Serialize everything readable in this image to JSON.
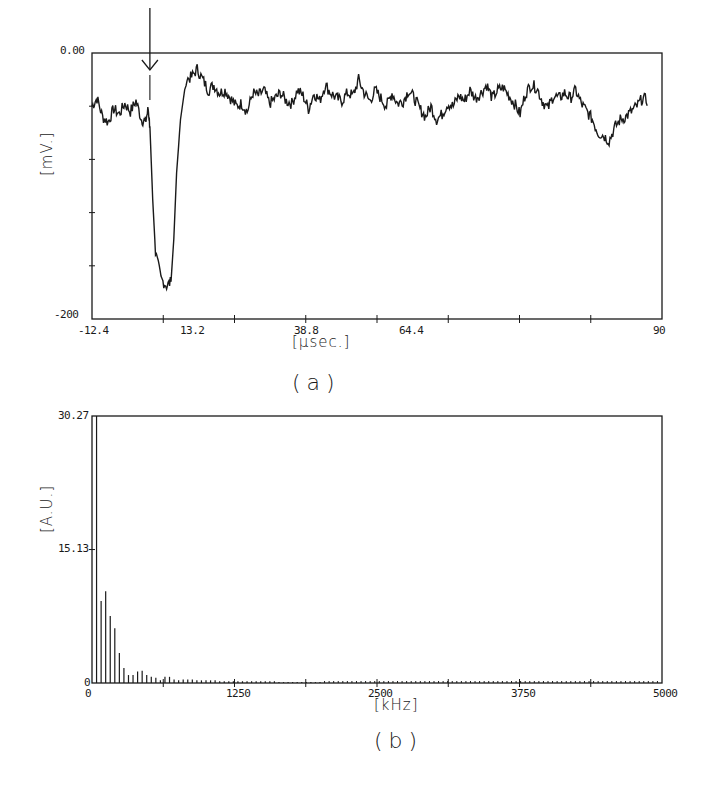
{
  "chart_data": [
    {
      "id": "a",
      "type": "line",
      "caption": "(a)",
      "title": "",
      "xlabel": "[µsec.]",
      "ylabel": "[mV.]",
      "xlim": [
        -12.4,
        90
      ],
      "ylim": [
        -200,
        0
      ],
      "x_ticks": [
        "-12.4",
        "13.2",
        "38.8",
        "64.4",
        "90"
      ],
      "y_ticks": [
        "0.00",
        "-200"
      ],
      "y_minor_ticks": 5,
      "x_minor_ticks": 8,
      "grid": false,
      "annotation": {
        "type": "arrow-down",
        "x": -2.0,
        "label": ""
      },
      "series": [
        {
          "name": "signal",
          "x": [
            -12.4,
            -11.5,
            -10.5,
            -9.5,
            -8.5,
            -7.5,
            -6.5,
            -5.5,
            -4.5,
            -3.5,
            -2.8,
            -2.3,
            -2.0,
            -1.5,
            -1.0,
            0.0,
            1.0,
            1.8,
            2.3,
            2.8,
            3.5,
            4.5,
            5.5,
            6.5,
            7.5,
            8.5,
            9.5,
            10.5,
            11.5,
            12.5,
            13.5,
            14.5,
            15.5,
            16.5,
            17.5,
            18.5,
            19.5,
            20.5,
            21.5,
            22.5,
            23.5,
            24.5,
            25.5,
            26.5,
            27.5,
            28.5,
            29.5,
            30.5,
            31.5,
            32.5,
            33.5,
            34.5,
            35.5,
            36.5,
            37.5,
            38.5,
            39.5,
            40.5,
            41.5,
            42.5,
            43.5,
            44.5,
            45.5,
            46.5,
            47.5,
            48.5,
            49.5,
            50.5,
            51.5,
            52.5,
            53.5,
            54.5,
            55.5,
            56.5,
            57.5,
            58.5,
            59.5,
            60.5,
            61.5,
            62.5,
            63.5,
            64.5,
            65.5,
            66.5,
            67.5,
            68.5,
            69.5,
            70.5,
            71.5,
            72.5,
            73.5,
            74.5,
            75.5,
            76.5,
            77.5,
            78.5,
            79.5,
            80.5,
            81.5,
            82.5,
            83.5,
            84.5,
            85.5,
            86.5,
            87.5,
            88.5,
            89.5,
            90
          ],
          "y": [
            -40,
            -34,
            -48,
            -52,
            -42,
            -46,
            -38,
            -44,
            -36,
            -50,
            -52,
            -42,
            -55,
            -110,
            -150,
            -170,
            -175,
            -172,
            -140,
            -90,
            -50,
            -20,
            -18,
            -12,
            -20,
            -28,
            -24,
            -30,
            -28,
            -34,
            -40,
            -38,
            -44,
            -30,
            -32,
            -28,
            -38,
            -34,
            -30,
            -36,
            -38,
            -28,
            -32,
            -42,
            -30,
            -36,
            -24,
            -30,
            -34,
            -36,
            -30,
            -32,
            -20,
            -30,
            -36,
            -28,
            -34,
            -40,
            -30,
            -38,
            -36,
            -28,
            -34,
            -42,
            -48,
            -40,
            -50,
            -46,
            -38,
            -40,
            -32,
            -36,
            -28,
            -34,
            -30,
            -24,
            -34,
            -28,
            -26,
            -32,
            -38,
            -46,
            -30,
            -24,
            -26,
            -36,
            -42,
            -32,
            -34,
            -30,
            -34,
            -28,
            -38,
            -44,
            -50,
            -60,
            -62,
            -66,
            -56,
            -50,
            -48,
            -44,
            -40,
            -34,
            -36
          ],
          "min": {
            "x": 2.3,
            "y": -175
          }
        }
      ]
    },
    {
      "id": "b",
      "type": "bar",
      "caption": "(b)",
      "title": "",
      "xlabel": "[kHz]",
      "ylabel": "[A.U.]",
      "xlim": [
        0,
        5000
      ],
      "ylim": [
        0,
        30.27
      ],
      "x_ticks": [
        "0",
        "1250",
        "2500",
        "3750",
        "5000"
      ],
      "y_ticks": [
        "0",
        "15.13",
        "30.27"
      ],
      "x_minor_ticks": 8,
      "grid": false,
      "series": [
        {
          "name": "spectrum",
          "bar_spacing_khz": 40,
          "x": [
            40,
            80,
            120,
            160,
            200,
            240,
            280,
            320,
            360,
            400,
            440,
            480,
            520,
            560,
            600,
            640,
            680,
            720,
            760,
            800,
            840,
            880,
            920,
            960,
            1000,
            1040,
            1080,
            1120,
            1160,
            1200,
            1240,
            1280,
            1320,
            1360,
            1400,
            1440,
            1480,
            1520,
            1560,
            1600,
            1640,
            1680,
            1720,
            1760,
            1800,
            1840,
            1880,
            1920,
            1960,
            2000
          ],
          "values": [
            30.27,
            9.3,
            10.4,
            7.6,
            6.2,
            3.4,
            1.7,
            0.9,
            0.9,
            1.3,
            1.4,
            0.9,
            0.7,
            0.6,
            0.3,
            0.7,
            0.7,
            0.4,
            0.3,
            0.4,
            0.4,
            0.4,
            0.3,
            0.3,
            0.3,
            0.3,
            0.3,
            0.2,
            0.2,
            0.2,
            0.2,
            0.2,
            0.2,
            0.2,
            0.2,
            0.2,
            0.2,
            0.2,
            0.2,
            0.2,
            0.1,
            0.1,
            0.1,
            0.1,
            0.1,
            0.1,
            0.1,
            0.1,
            0.1,
            0.1
          ],
          "tail": "continues at ~0.1 A.U. spaced every 40 kHz up to 5000 kHz"
        }
      ]
    }
  ],
  "figure": {
    "caption_a": "(a)",
    "caption_b": "(b)"
  }
}
